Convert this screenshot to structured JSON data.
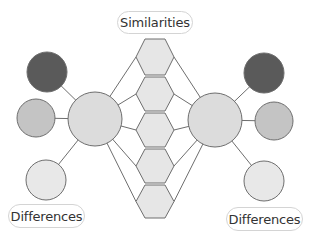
{
  "diagram": {
    "type": "double-bubble-map",
    "labels": {
      "similarities": "Similarities",
      "differences_left": "Differences",
      "differences_right": "Differences"
    },
    "colors": {
      "line": "#6e6e6e",
      "dark_circle": "#5a5a5a",
      "medium_circle": "#c4c4c4",
      "light_circle": "#e8e8e8",
      "main_circle": "#dcdcdc",
      "hexagon": "#e6e6e6",
      "label_border": "#d4d4d4"
    },
    "main_circles": [
      {
        "id": "left-main",
        "cx": 95,
        "cy": 119,
        "r": 27
      },
      {
        "id": "right-main",
        "cx": 215,
        "cy": 120,
        "r": 27
      }
    ],
    "left_difference_circles": [
      {
        "shade": "dark",
        "cx": 47,
        "cy": 72,
        "r": 20
      },
      {
        "shade": "medium",
        "cx": 36,
        "cy": 118,
        "r": 19
      },
      {
        "shade": "light",
        "cx": 46,
        "cy": 180,
        "r": 20
      }
    ],
    "right_difference_circles": [
      {
        "shade": "dark",
        "cx": 264,
        "cy": 73,
        "r": 20
      },
      {
        "shade": "medium",
        "cx": 274,
        "cy": 121,
        "r": 19
      },
      {
        "shade": "light",
        "cx": 264,
        "cy": 181,
        "r": 20
      }
    ],
    "similarity_hexagons": [
      {
        "top": 39,
        "bottom": 75
      },
      {
        "top": 77,
        "bottom": 111
      },
      {
        "top": 113,
        "bottom": 147
      },
      {
        "top": 149,
        "bottom": 183
      },
      {
        "top": 185,
        "bottom": 218
      }
    ],
    "hexagon_x": {
      "left": 136,
      "inner_left": 145,
      "inner_right": 165,
      "right": 174
    }
  }
}
